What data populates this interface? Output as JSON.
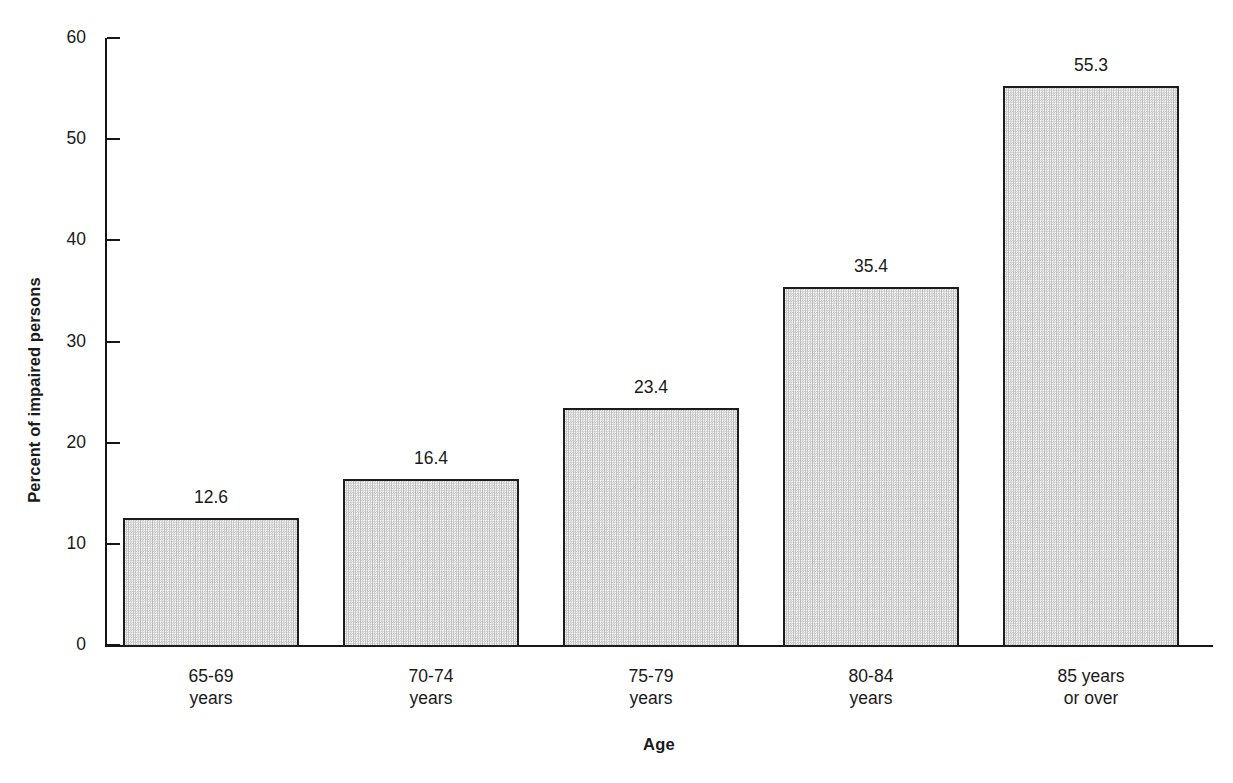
{
  "chart_data": {
    "type": "bar",
    "title": "",
    "subtitle": "",
    "xlabel": "Age",
    "ylabel": "Percent of impaired persons",
    "categories": [
      "65-69\nyears",
      "70-74\nyears",
      "75-79\nyears",
      "80-84\nyears",
      "85 years\nor over"
    ],
    "category_lines": [
      [
        "65-69",
        "years"
      ],
      [
        "70-74",
        "years"
      ],
      [
        "75-79",
        "years"
      ],
      [
        "80-84",
        "years"
      ],
      [
        "85 years",
        "or over"
      ]
    ],
    "values": [
      12.6,
      16.4,
      23.4,
      35.4,
      55.3
    ],
    "value_labels": [
      "12.6",
      "16.4",
      "23.4",
      "35.4",
      "55.3"
    ],
    "ylim": [
      0,
      60
    ],
    "ytick_values": [
      0,
      10,
      20,
      30,
      40,
      50,
      60
    ],
    "ytick_labels": [
      "0",
      "10",
      "20",
      "30",
      "40",
      "50",
      "60"
    ],
    "grid": false,
    "legend": false,
    "legend_position": "none",
    "bar_fill": "checkerboard-stipple-gray",
    "bar_edge_color": "#1c1c1c",
    "background_color": "#ffffff",
    "text_color": "#1a1a1a",
    "value_labels_above_bars": true,
    "series": [
      {
        "name": "Percent of impaired persons",
        "values": [
          12.6,
          16.4,
          23.4,
          35.4,
          55.3
        ]
      }
    ]
  },
  "axes": {
    "y_axis_name": "y-axis",
    "x_axis_name": "x-axis"
  }
}
